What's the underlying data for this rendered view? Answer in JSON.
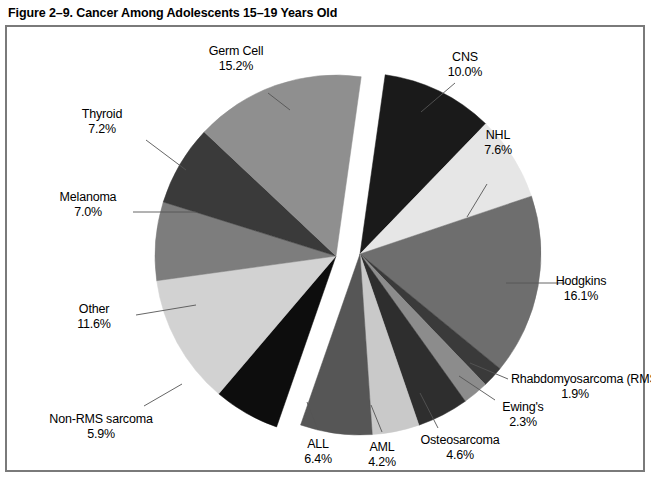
{
  "figure": {
    "title": "Figure 2–9. Cancer Among Adolescents 15–19 Years Old"
  },
  "chart_data": {
    "type": "pie",
    "title": "Figure 2–9. Cancer Among Adolescents 15–19 Years Old",
    "unit": "percent",
    "exploded": true,
    "explode_note": "Pie is split into two groups separated by a wedge-shaped gap",
    "categories": [
      "CNS",
      "NHL",
      "Hodgkins",
      "Rhabdomyosarcoma (RMS)",
      "Ewing's",
      "Osteosarcoma",
      "AML",
      "ALL",
      "Non-RMS sarcoma",
      "Other",
      "Melanoma",
      "Thyroid",
      "Germ Cell"
    ],
    "values": [
      10.0,
      7.6,
      16.1,
      1.9,
      2.3,
      4.6,
      4.2,
      6.4,
      5.9,
      11.6,
      7.0,
      7.2,
      15.2
    ],
    "colors": [
      "#1a1a1a",
      "#e6e6e6",
      "#6e6e6e",
      "#3a3a3a",
      "#8c8c8c",
      "#2e2e2e",
      "#c9c9c9",
      "#565656",
      "#0d0d0d",
      "#d2d2d2",
      "#7d7d7d",
      "#3a3a3a",
      "#8f8f8f"
    ],
    "slices": [
      {
        "label": "CNS",
        "value": 10.0,
        "value_text": "10.0%",
        "color": "#1a1a1a",
        "group": "right"
      },
      {
        "label": "NHL",
        "value": 7.6,
        "value_text": "7.6%",
        "color": "#e6e6e6",
        "group": "right"
      },
      {
        "label": "Hodgkins",
        "value": 16.1,
        "value_text": "16.1%",
        "color": "#6e6e6e",
        "group": "right"
      },
      {
        "label": "Rhabdomyosarcoma (RMS)",
        "value": 1.9,
        "value_text": "1.9%",
        "color": "#3a3a3a",
        "group": "right"
      },
      {
        "label": "Ewing's",
        "value": 2.3,
        "value_text": "2.3%",
        "color": "#8c8c8c",
        "group": "right"
      },
      {
        "label": "Osteosarcoma",
        "value": 4.6,
        "value_text": "4.6%",
        "color": "#2e2e2e",
        "group": "right"
      },
      {
        "label": "AML",
        "value": 4.2,
        "value_text": "4.2%",
        "color": "#c9c9c9",
        "group": "right"
      },
      {
        "label": "ALL",
        "value": 6.4,
        "value_text": "6.4%",
        "color": "#565656",
        "group": "right"
      },
      {
        "label": "Non-RMS sarcoma",
        "value": 5.9,
        "value_text": "5.9%",
        "color": "#0d0d0d",
        "group": "left"
      },
      {
        "label": "Other",
        "value": 11.6,
        "value_text": "11.6%",
        "color": "#d2d2d2",
        "group": "left"
      },
      {
        "label": "Melanoma",
        "value": 7.0,
        "value_text": "7.0%",
        "color": "#7d7d7d",
        "group": "left"
      },
      {
        "label": "Thyroid",
        "value": 7.2,
        "value_text": "7.2%",
        "color": "#3a3a3a",
        "group": "left"
      },
      {
        "label": "Germ Cell",
        "value": 15.2,
        "value_text": "15.2%",
        "color": "#8f8f8f",
        "group": "left"
      }
    ],
    "legend": "none (direct labels with leader lines)",
    "grid": false
  },
  "labels": {
    "germ_cell": {
      "name": "Germ Cell",
      "pct": "15.2%"
    },
    "thyroid": {
      "name": "Thyroid",
      "pct": "7.2%"
    },
    "melanoma": {
      "name": "Melanoma",
      "pct": "7.0%"
    },
    "other": {
      "name": "Other",
      "pct": "11.6%"
    },
    "non_rms": {
      "name": "Non-RMS sarcoma",
      "pct": "5.9%"
    },
    "all": {
      "name": "ALL",
      "pct": "6.4%"
    },
    "aml": {
      "name": "AML",
      "pct": "4.2%"
    },
    "osteosarcoma": {
      "name": "Osteosarcoma",
      "pct": "4.6%"
    },
    "ewings": {
      "name": "Ewing's",
      "pct": "2.3%"
    },
    "rms": {
      "name": "Rhabdomyosarcoma (RMS)",
      "pct": "1.9%"
    },
    "hodgkins": {
      "name": "Hodgkins",
      "pct": "16.1%"
    },
    "nhl": {
      "name": "NHL",
      "pct": "7.6%"
    },
    "cns": {
      "name": "CNS",
      "pct": "10.0%"
    }
  }
}
